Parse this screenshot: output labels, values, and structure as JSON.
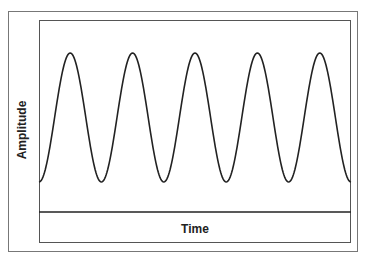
{
  "chart_data": {
    "type": "line",
    "title": "",
    "xlabel": "Time",
    "ylabel": "Amplitude",
    "series": [
      {
        "name": "sine wave",
        "cycles": 5,
        "start_phase": "trough",
        "end_phase": "trough"
      }
    ],
    "grid": false,
    "legend": null
  },
  "labels": {
    "x_axis": "Time",
    "y_axis": "Amplitude"
  },
  "colors": {
    "line": "#222222",
    "frame": "#777777",
    "background": "#ffffff"
  }
}
